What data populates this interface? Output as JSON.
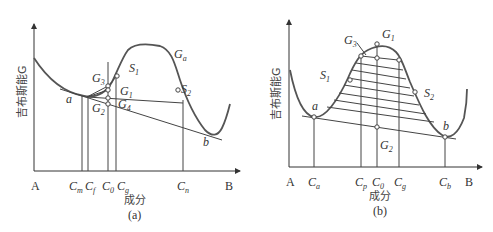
{
  "figure": {
    "panels": [
      {
        "id": "a",
        "caption": "(a)",
        "y_axis_label": "吉布斯能G",
        "x_axis_label": "成分",
        "x_end_labels": {
          "left": "A",
          "right": "B"
        },
        "curve_label": "G_a",
        "x_ticks": [
          {
            "base": "C",
            "sub": "m"
          },
          {
            "base": "C",
            "sub": "f"
          },
          {
            "base": "C",
            "sub": "0"
          },
          {
            "base": "C",
            "sub": "g"
          },
          {
            "base": "C",
            "sub": "n"
          }
        ],
        "point_labels": {
          "a": "a",
          "b": "b",
          "S1": {
            "base": "S",
            "sub": "1"
          },
          "S2": {
            "base": "S",
            "sub": "2"
          },
          "G1": {
            "base": "G",
            "sub": "1"
          },
          "G2": {
            "base": "G",
            "sub": "2"
          },
          "G3": {
            "base": "G",
            "sub": "3"
          },
          "G4": {
            "base": "G",
            "sub": "4"
          },
          "Ga": {
            "base": "G",
            "sub": "a"
          }
        }
      },
      {
        "id": "b",
        "caption": "(b)",
        "y_axis_label": "吉布斯能G",
        "x_axis_label": "成分",
        "x_end_labels": {
          "left": "A",
          "right": "B"
        },
        "x_ticks": [
          {
            "base": "C",
            "sub": "a"
          },
          {
            "base": "C",
            "sub": "p"
          },
          {
            "base": "C",
            "sub": "0"
          },
          {
            "base": "C",
            "sub": "g"
          },
          {
            "base": "C",
            "sub": "b"
          }
        ],
        "point_labels": {
          "a": "a",
          "b": "b",
          "S1": {
            "base": "S",
            "sub": "1"
          },
          "S2": {
            "base": "S",
            "sub": "2"
          },
          "G1": {
            "base": "G",
            "sub": "1"
          },
          "G2": {
            "base": "G",
            "sub": "2"
          },
          "G3": {
            "base": "G",
            "sub": "3"
          }
        }
      }
    ]
  }
}
